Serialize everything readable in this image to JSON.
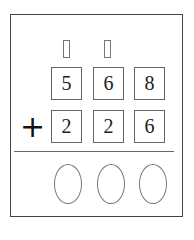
{
  "problem": {
    "carry_boxes": [
      "",
      ""
    ],
    "top_row": [
      "5",
      "6",
      "8"
    ],
    "operator": "+",
    "bottom_row": [
      "2",
      "2",
      "6"
    ],
    "answer_ovals": [
      "",
      "",
      ""
    ]
  }
}
